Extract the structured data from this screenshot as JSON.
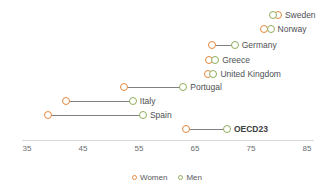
{
  "chart_data": {
    "type": "scatter",
    "subtype": "dumbbell",
    "title": "",
    "xlabel": "",
    "ylabel": "",
    "xlim": [
      32,
      87
    ],
    "grid": false,
    "legend_position": "bottom-center",
    "ticks": [
      35,
      45,
      55,
      65,
      75,
      85
    ],
    "series": [
      {
        "name": "Women",
        "color": "#e4893f"
      },
      {
        "name": "Men",
        "color": "#8fad5c"
      }
    ],
    "categories": [
      "Sweden",
      "Norway",
      "Germany",
      "Greece",
      "United Kingdom",
      "Portugal",
      "Italy",
      "Spain",
      "OECD23"
    ],
    "rows": [
      {
        "label": "Sweden",
        "women": 79.8,
        "men": 79.0,
        "highlight": false
      },
      {
        "label": "Norway",
        "women": 77.3,
        "men": 78.5,
        "highlight": false
      },
      {
        "label": "Germany",
        "women": 68.0,
        "men": 72.1,
        "highlight": false
      },
      {
        "label": "Greece",
        "women": 67.5,
        "men": 68.6,
        "highlight": false
      },
      {
        "label": "United Kingdom",
        "women": 67.3,
        "men": 68.3,
        "highlight": false
      },
      {
        "label": "Portugal",
        "women": 52.3,
        "men": 62.9,
        "highlight": false
      },
      {
        "label": "Italy",
        "women": 42.0,
        "men": 53.9,
        "highlight": false
      },
      {
        "label": "Spain",
        "women": 38.8,
        "men": 55.7,
        "highlight": false
      },
      {
        "label": "OECD23",
        "women": 63.4,
        "men": 70.7,
        "highlight": true
      }
    ]
  },
  "legend": {
    "items": [
      {
        "label": "Women",
        "key": "women"
      },
      {
        "label": "Men",
        "key": "men"
      }
    ]
  }
}
